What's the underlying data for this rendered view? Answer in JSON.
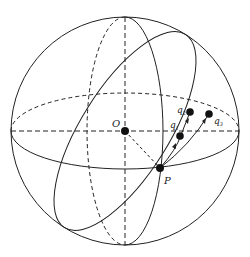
{
  "diagram": {
    "type": "sphere-geodesic",
    "labels": {
      "center": "O",
      "point": "P",
      "q1": "q",
      "q1_sub": "1",
      "q2": "q",
      "q2_sub": "2",
      "q3": "q",
      "q3_sub": "3"
    },
    "colors": {
      "stroke": "#222222",
      "fill": "#111111",
      "background": "#ffffff"
    }
  }
}
